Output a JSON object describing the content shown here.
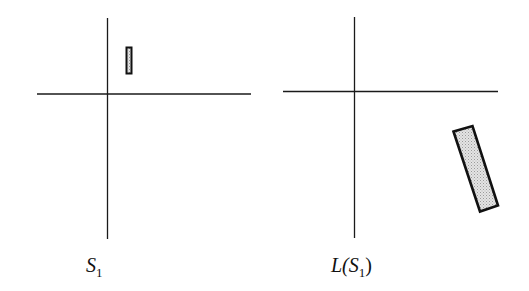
{
  "panels": [
    {
      "id": "left",
      "label_name": "S",
      "label_subscript": "1",
      "label_prefix": "",
      "label_suffix": ""
    },
    {
      "id": "right",
      "label_prefix": "L(",
      "label_name": "S",
      "label_subscript": "1",
      "label_suffix": ")"
    }
  ],
  "colors": {
    "axis": "#1a1a1a",
    "shape_stroke": "#111111",
    "shape_fill": "#cfcfcf"
  }
}
